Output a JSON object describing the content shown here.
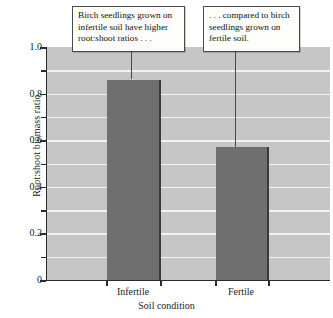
{
  "chart_data": {
    "type": "bar",
    "title": "",
    "xlabel": "Soil condition",
    "ylabel": "Root:shoot biomass ratio",
    "categories": [
      "Infertile",
      "Fertile"
    ],
    "values": [
      0.86,
      0.57
    ],
    "ylim": [
      0,
      1.0
    ],
    "ytick_labels": [
      "0",
      "0.2",
      "0.4",
      "0.6",
      "0.8",
      "1.0"
    ],
    "ytick_values": [
      0,
      0.2,
      0.4,
      0.6,
      0.8,
      1.0
    ],
    "minor_tick_values": [
      0.1,
      0.3,
      0.5,
      0.7,
      0.9
    ],
    "grid": true,
    "grid_interval": 0.1,
    "legend": "none",
    "series": [
      {
        "name": "Root:shoot biomass ratio",
        "values": [
          0.86,
          0.57
        ]
      }
    ],
    "annotations": [
      {
        "id": "callout-infertile",
        "text": "Birch seedlings grown on infertile soil have higher root:shoot ratios . . .",
        "points_to": "Infertile"
      },
      {
        "id": "callout-fertile",
        "text": ". . . compared to birch seedlings grown on fertile soil.",
        "points_to": "Fertile"
      }
    ],
    "colors": {
      "bar_fill": "#6f6f6f",
      "bar_edge": "#3a3a3a",
      "plot_background": "#c6c6c6",
      "gridline": "#f2f2f2",
      "axis": "#2b2b2b",
      "callout_background": "#fdfdfa",
      "callout_border": "#4a4a4a"
    }
  }
}
